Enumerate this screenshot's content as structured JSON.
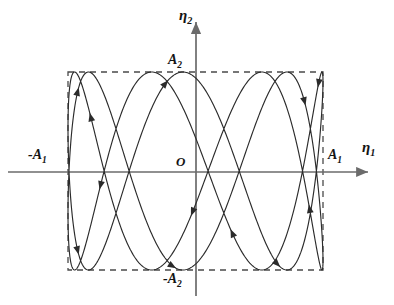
{
  "figure": {
    "kind": "lissajous-phase-portrait",
    "background_color": "#ffffff",
    "curve_color": "#2b2b2b",
    "axis_color": "#6b6b6b",
    "dashed_color": "#4a4a4a",
    "text_color": "#141414"
  },
  "axes": {
    "horizontal": {
      "name": "eta1-axis",
      "label": "η",
      "label_subscript": "1",
      "y_px": 172,
      "x_start_px": 8,
      "x_end_px": 368,
      "arrow": "right"
    },
    "vertical": {
      "name": "eta2-axis",
      "label": "η",
      "label_subscript": "2",
      "x_px": 196,
      "y_start_px": 296,
      "y_end_px": 22,
      "arrow": "up"
    }
  },
  "labels": {
    "origin": "O",
    "eta1": "η",
    "eta1_sub": "1",
    "eta2": "η",
    "eta2_sub": "2",
    "A1_positive": "A",
    "A1_positive_sub": "1",
    "A1_negative": "-A",
    "A1_negative_sub": "1",
    "A2_positive": "A",
    "A2_positive_sub": "2",
    "A2_negative": "-A",
    "A2_negative_sub": "2"
  },
  "bounding_box": {
    "name": "amplitude-bounding-rectangle",
    "style": "dashed",
    "left_px": 68,
    "right_px": 323,
    "top_px": 72,
    "bottom_px": 270,
    "dash_pattern": "6 5",
    "meaning": "|eta1| <= A1 and |eta2| <= A2"
  },
  "chart_data": {
    "type": "line",
    "title": "",
    "xlabel": "η1",
    "ylabel": "η2",
    "xlim": [
      -1,
      1
    ],
    "ylim": [
      -1,
      1
    ],
    "grid": false,
    "legend": null,
    "parametric": {
      "x_expr": "A1*sin(w1*t + phi)",
      "y_expr": "A2*sin(w2*t)",
      "amplitude_x": 1,
      "amplitude_y": 1,
      "frequency_ratio_y_over_x": 3.5,
      "phase_offset_rad": 0.35,
      "t_range": [
        0,
        12.566370614359172
      ],
      "samples": 1400
    },
    "top_tangent_points_px": [
      88,
      196,
      232,
      270
    ],
    "bottom_tangent_points_px": [
      133,
      168,
      200,
      286
    ],
    "direction_arrows": [
      {
        "t_fraction": 0.055,
        "note": "descending left branch"
      },
      {
        "t_fraction": 0.135,
        "note": "descending toward bottom left"
      },
      {
        "t_fraction": 0.225,
        "note": "ascending mid-left"
      },
      {
        "t_fraction": 0.3,
        "note": "descending inner"
      },
      {
        "t_fraction": 0.38,
        "note": "ascending toward top"
      },
      {
        "t_fraction": 0.455,
        "note": "descending from top"
      },
      {
        "t_fraction": 0.53,
        "note": "descending inner right"
      },
      {
        "t_fraction": 0.62,
        "note": "descending right branch"
      },
      {
        "t_fraction": 0.7,
        "note": "descending far right"
      },
      {
        "t_fraction": 0.79,
        "note": "ascending right"
      },
      {
        "t_fraction": 0.88,
        "note": "ascending far right"
      },
      {
        "t_fraction": 0.96,
        "note": "closing loop"
      }
    ]
  }
}
